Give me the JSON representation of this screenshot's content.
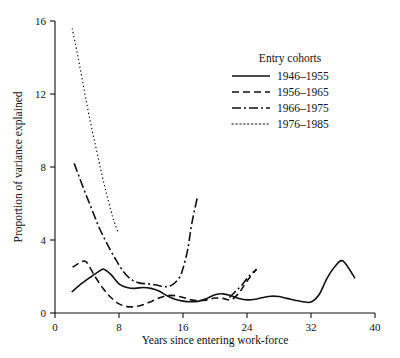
{
  "chart_data": {
    "type": "line",
    "title": "",
    "xlabel": "Years since entering work-force",
    "ylabel": "Proportion of variance explained",
    "xlim": [
      0,
      40
    ],
    "ylim": [
      0,
      16
    ],
    "xticks": [
      0,
      8,
      16,
      24,
      32,
      40
    ],
    "yticks": [
      0,
      4,
      8,
      12,
      16
    ],
    "xtick_labels": [
      "0",
      "8",
      "16",
      "24",
      "32",
      "40"
    ],
    "ytick_labels": [
      "0",
      "4",
      "8",
      "12",
      "16"
    ],
    "grid": false,
    "legend_position": "upper right",
    "legend_title": "Entry cohorts",
    "line_color": "#111111",
    "series": [
      {
        "name": "1946–1955",
        "style": "solid",
        "dasharray": "",
        "x": [
          2.1,
          3.0,
          4.4,
          5.4,
          6.1,
          7.0,
          8.0,
          9.0,
          10.0,
          11.0,
          12.0,
          13.0,
          14.0,
          15.0,
          16.0,
          17.0,
          18.0,
          19.0,
          20.0,
          21.0,
          22.0,
          23.0,
          24.0,
          25.0,
          26.0,
          27.0,
          28.0,
          29.0,
          30.0,
          31.0,
          32.0,
          33.0,
          34.0,
          35.0,
          36.0,
          37.5
        ],
        "y": [
          1.15,
          1.5,
          1.95,
          2.25,
          2.4,
          2.1,
          1.6,
          1.4,
          1.35,
          1.4,
          1.35,
          1.2,
          0.95,
          0.75,
          0.65,
          0.62,
          0.65,
          0.8,
          1.0,
          1.05,
          0.95,
          0.8,
          0.72,
          0.75,
          0.85,
          0.92,
          0.9,
          0.8,
          0.7,
          0.62,
          0.6,
          1.0,
          1.9,
          2.55,
          2.85,
          1.9
        ]
      },
      {
        "name": "1956–1965",
        "style": "dashed",
        "dasharray": "7,4",
        "x": [
          2.2,
          3.1,
          3.9,
          5.0,
          6.0,
          7.0,
          8.0,
          9.0,
          10.0,
          11.0,
          12.0,
          13.0,
          14.0,
          15.0,
          16.0,
          17.0,
          18.0,
          19.0,
          20.0,
          21.0,
          22.0,
          23.0,
          24.0,
          25.2
        ],
        "y": [
          2.5,
          2.75,
          2.8,
          2.0,
          1.35,
          0.85,
          0.5,
          0.35,
          0.35,
          0.45,
          0.62,
          0.82,
          0.95,
          0.95,
          0.85,
          0.72,
          0.68,
          0.72,
          0.82,
          0.8,
          0.72,
          1.1,
          1.75,
          2.4
        ]
      },
      {
        "name": "1966–1975",
        "style": "dashdot",
        "dasharray": "9,3,2,3",
        "x": [
          2.4,
          3.5,
          4.5,
          5.5,
          6.5,
          7.5,
          8.5,
          9.5,
          10.5,
          11.5,
          12.5,
          13.5,
          14.5,
          15.5,
          16.0,
          16.6,
          17.1,
          17.8
        ],
        "y": [
          8.2,
          6.9,
          5.8,
          4.7,
          3.8,
          3.0,
          2.3,
          1.85,
          1.65,
          1.6,
          1.55,
          1.45,
          1.5,
          1.9,
          2.45,
          3.5,
          4.9,
          6.35
        ]
      },
      {
        "name": "1966–1975",
        "style": "dashdot",
        "dasharray": "9,3,2,3",
        "x": [
          21.8,
          22.6,
          23.4,
          24.2,
          25.2
        ],
        "y": [
          0.85,
          1.2,
          1.55,
          2.0,
          2.4
        ]
      },
      {
        "name": "1976–1985",
        "style": "dotted",
        "dasharray": "1.3,2.6",
        "x": [
          2.15,
          2.8,
          3.4,
          4.0,
          4.6,
          5.2,
          5.8,
          6.4,
          7.0,
          7.4,
          7.9
        ],
        "y": [
          15.6,
          14.2,
          12.8,
          11.4,
          10.1,
          8.9,
          7.7,
          6.6,
          5.6,
          5.0,
          4.4
        ]
      }
    ],
    "legend_entries": [
      {
        "label": "1946–1955",
        "style": "solid",
        "dasharray": ""
      },
      {
        "label": "1956–1965",
        "style": "dashed",
        "dasharray": "7,4"
      },
      {
        "label": "1966–1975",
        "style": "dashdot",
        "dasharray": "9,3,2,3"
      },
      {
        "label": "1976–1985",
        "style": "dotted",
        "dasharray": "1.3,2.6"
      }
    ]
  }
}
